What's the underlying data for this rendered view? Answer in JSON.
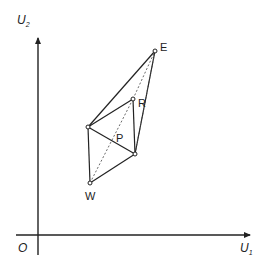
{
  "diagram": {
    "axes": {
      "y_label": "U",
      "y_sub": "2",
      "x_label": "U",
      "x_sub": "1",
      "origin_label": "O"
    },
    "points": {
      "E": {
        "label": "E"
      },
      "R": {
        "label": "R"
      },
      "P": {
        "label": "P"
      },
      "W": {
        "label": "W"
      }
    },
    "colors": {
      "stroke": "#222222",
      "background": "#ffffff"
    }
  }
}
